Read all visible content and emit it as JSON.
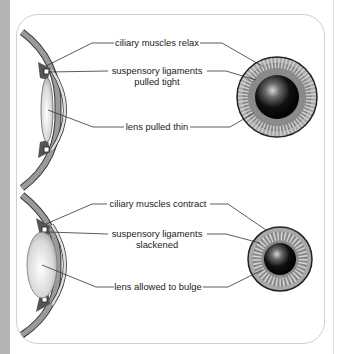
{
  "diagram": {
    "panels": [
      {
        "id": "distant-focus",
        "labels": {
          "ciliary": "ciliary muscles relax",
          "ligament_line1": "suspensory ligaments",
          "ligament_line2": "pulled tight",
          "lens": "lens pulled thin"
        },
        "lens_shape": "thin",
        "front_view": {
          "outer_radius": 40,
          "pupil_radius": 22
        }
      },
      {
        "id": "near-focus",
        "labels": {
          "ciliary": "ciliary muscles contract",
          "ligament_line1": "suspensory ligaments",
          "ligament_line2": "slackened",
          "lens": "lens allowed to bulge"
        },
        "lens_shape": "bulging",
        "front_view": {
          "outer_radius": 32,
          "pupil_radius": 16
        }
      }
    ],
    "colors": {
      "sclera": "#8a8a8a",
      "iris_ring": "#a8a8a8",
      "pupil": "#000000",
      "leader_line": "#333333",
      "panel_border": "#d0d0d0",
      "side_strip": "#b4b4b4"
    }
  }
}
